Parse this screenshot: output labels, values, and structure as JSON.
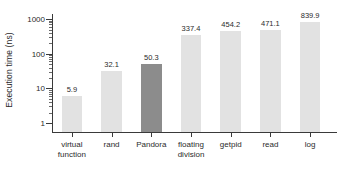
{
  "chart_data": {
    "type": "bar",
    "title": "",
    "xlabel": "",
    "ylabel": "Execution time (ns)",
    "yscale": "log",
    "ylim": [
      0.55,
      1400
    ],
    "grid": false,
    "legend": null,
    "ytick_labels": [
      "1",
      "10",
      "100",
      "1000"
    ],
    "ytick_values": [
      1,
      10,
      100,
      1000
    ],
    "categories": [
      "virtual function",
      "rand",
      "Pandora",
      "floating division",
      "getpid",
      "read",
      "log"
    ],
    "category_lines": [
      [
        "virtual",
        "function"
      ],
      [
        "rand",
        ""
      ],
      [
        "Pandora",
        ""
      ],
      [
        "floating",
        "division"
      ],
      [
        "getpid",
        ""
      ],
      [
        "read",
        ""
      ],
      [
        "log",
        ""
      ]
    ],
    "values": [
      5.9,
      32.1,
      50.3,
      337.4,
      454.2,
      471.1,
      839.9
    ],
    "value_labels": [
      "5.9",
      "32.1",
      "50.3",
      "337.4",
      "454.2",
      "471.1",
      "839.9"
    ],
    "highlight_index": 2,
    "colors": {
      "bar": "#e2e2e2",
      "bar_highlight": "#8c8c8c",
      "axis": "#3a3a3a",
      "text": "#2b2b2b",
      "background": "#ffffff"
    }
  }
}
